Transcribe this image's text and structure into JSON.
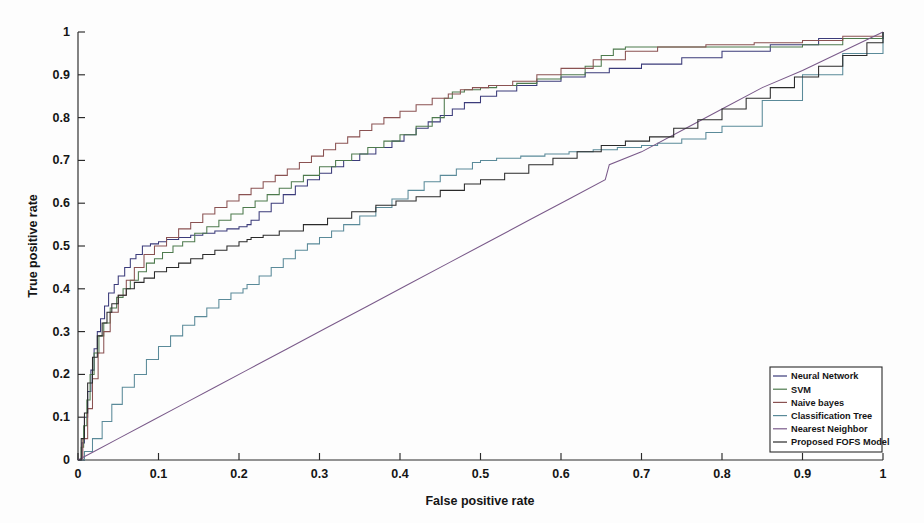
{
  "figure": {
    "background_color": "#fdfdfd",
    "type": "roc-curve-figure"
  },
  "axes": {
    "x_title": "False positive rate",
    "y_title": "True positive rate",
    "x_ticks": [
      "0",
      "0.1",
      "0.2",
      "0.3",
      "0.4",
      "0.5",
      "0.6",
      "0.7",
      "0.8",
      "0.9",
      "1"
    ],
    "y_ticks": [
      "0",
      "0.1",
      "0.2",
      "0.3",
      "0.4",
      "0.5",
      "0.6",
      "0.7",
      "0.8",
      "0.9",
      "1"
    ],
    "axis_color": "#2a2a2a"
  },
  "legend": {
    "position": "bottom-right",
    "entries": [
      {
        "label": "Neural Network",
        "color": "#3b3b7a"
      },
      {
        "label": "SVM",
        "color": "#4d7a4d"
      },
      {
        "label": "Naive bayes",
        "color": "#8a5252"
      },
      {
        "label": "Classification Tree",
        "color": "#5a8a99"
      },
      {
        "label": "Nearest Neighbor",
        "color": "#7a5a8a"
      },
      {
        "label": "Proposed FOFS Model",
        "color": "#2a2a2a"
      }
    ]
  },
  "chart_data": {
    "type": "line",
    "title": "",
    "subtitle": "",
    "xlabel": "False positive rate",
    "ylabel": "True positive rate",
    "xlim": [
      0,
      1
    ],
    "ylim": [
      0,
      1
    ],
    "grid": false,
    "legend_position": "lower right",
    "step_style": "post",
    "series": [
      {
        "name": "Neural Network",
        "color": "#3b3b7a",
        "x": [
          0,
          0.005,
          0.008,
          0.012,
          0.016,
          0.02,
          0.024,
          0.028,
          0.033,
          0.038,
          0.045,
          0.05,
          0.058,
          0.065,
          0.072,
          0.08,
          0.09,
          0.1,
          0.11,
          0.125,
          0.14,
          0.155,
          0.17,
          0.185,
          0.2,
          0.21,
          0.215,
          0.225,
          0.24,
          0.255,
          0.27,
          0.285,
          0.3,
          0.315,
          0.33,
          0.35,
          0.37,
          0.39,
          0.405,
          0.42,
          0.435,
          0.45,
          0.465,
          0.48,
          0.5,
          0.52,
          0.545,
          0.57,
          0.6,
          0.63,
          0.66,
          0.7,
          0.75,
          0.8,
          0.86,
          0.92,
          1.0
        ],
        "y": [
          0,
          0.04,
          0.1,
          0.16,
          0.21,
          0.26,
          0.3,
          0.33,
          0.36,
          0.39,
          0.41,
          0.43,
          0.45,
          0.47,
          0.48,
          0.5,
          0.505,
          0.51,
          0.515,
          0.52,
          0.525,
          0.53,
          0.535,
          0.54,
          0.545,
          0.55,
          0.56,
          0.58,
          0.6,
          0.62,
          0.64,
          0.655,
          0.67,
          0.685,
          0.7,
          0.715,
          0.73,
          0.745,
          0.76,
          0.775,
          0.79,
          0.805,
          0.82,
          0.835,
          0.85,
          0.862,
          0.875,
          0.885,
          0.895,
          0.905,
          0.915,
          0.925,
          0.94,
          0.955,
          0.97,
          0.985,
          1.0
        ]
      },
      {
        "name": "SVM",
        "color": "#4d7a4d",
        "x": [
          0,
          0.004,
          0.007,
          0.011,
          0.015,
          0.02,
          0.026,
          0.032,
          0.04,
          0.048,
          0.056,
          0.065,
          0.075,
          0.085,
          0.095,
          0.105,
          0.118,
          0.13,
          0.145,
          0.16,
          0.175,
          0.19,
          0.205,
          0.22,
          0.235,
          0.25,
          0.265,
          0.28,
          0.3,
          0.32,
          0.34,
          0.36,
          0.38,
          0.4,
          0.42,
          0.44,
          0.455,
          0.465,
          0.48,
          0.5,
          0.52,
          0.545,
          0.57,
          0.6,
          0.63,
          0.65,
          0.665,
          0.68,
          0.72,
          0.78,
          0.85,
          0.9,
          0.95,
          1.0
        ],
        "y": [
          0,
          0.03,
          0.08,
          0.14,
          0.2,
          0.25,
          0.29,
          0.32,
          0.355,
          0.38,
          0.4,
          0.42,
          0.44,
          0.46,
          0.47,
          0.485,
          0.5,
          0.51,
          0.53,
          0.545,
          0.56,
          0.575,
          0.59,
          0.605,
          0.62,
          0.635,
          0.65,
          0.665,
          0.685,
          0.7,
          0.715,
          0.73,
          0.745,
          0.76,
          0.78,
          0.8,
          0.845,
          0.86,
          0.865,
          0.87,
          0.875,
          0.88,
          0.89,
          0.9,
          0.92,
          0.945,
          0.96,
          0.965,
          0.965,
          0.965,
          0.965,
          0.97,
          0.985,
          1.0
        ]
      },
      {
        "name": "Naive bayes",
        "color": "#8a5252",
        "x": [
          0,
          0.006,
          0.012,
          0.018,
          0.025,
          0.032,
          0.04,
          0.05,
          0.06,
          0.07,
          0.082,
          0.095,
          0.11,
          0.125,
          0.14,
          0.155,
          0.17,
          0.185,
          0.2,
          0.215,
          0.23,
          0.245,
          0.26,
          0.275,
          0.29,
          0.305,
          0.32,
          0.335,
          0.35,
          0.365,
          0.38,
          0.4,
          0.42,
          0.44,
          0.46,
          0.475,
          0.49,
          0.51,
          0.54,
          0.57,
          0.6,
          0.64,
          0.68,
          0.72,
          0.78,
          0.84,
          0.9,
          0.95,
          1.0
        ],
        "y": [
          0,
          0.05,
          0.12,
          0.19,
          0.25,
          0.3,
          0.345,
          0.385,
          0.42,
          0.45,
          0.48,
          0.5,
          0.52,
          0.54,
          0.555,
          0.575,
          0.59,
          0.605,
          0.62,
          0.635,
          0.65,
          0.665,
          0.68,
          0.695,
          0.71,
          0.725,
          0.74,
          0.755,
          0.77,
          0.785,
          0.8,
          0.815,
          0.83,
          0.845,
          0.855,
          0.865,
          0.87,
          0.875,
          0.885,
          0.9,
          0.915,
          0.935,
          0.955,
          0.965,
          0.97,
          0.975,
          0.98,
          0.99,
          1.0
        ]
      },
      {
        "name": "Classification Tree",
        "color": "#5a8a99",
        "x": [
          0,
          0.008,
          0.018,
          0.03,
          0.042,
          0.055,
          0.07,
          0.085,
          0.1,
          0.115,
          0.13,
          0.145,
          0.16,
          0.175,
          0.19,
          0.205,
          0.21,
          0.225,
          0.24,
          0.255,
          0.27,
          0.285,
          0.3,
          0.315,
          0.33,
          0.35,
          0.37,
          0.39,
          0.41,
          0.43,
          0.45,
          0.47,
          0.49,
          0.5,
          0.52,
          0.55,
          0.58,
          0.61,
          0.64,
          0.67,
          0.7,
          0.72,
          0.75,
          0.78,
          0.8,
          0.85,
          0.9,
          0.95,
          1.0
        ],
        "y": [
          0,
          0.02,
          0.05,
          0.09,
          0.13,
          0.17,
          0.2,
          0.235,
          0.265,
          0.29,
          0.315,
          0.335,
          0.355,
          0.375,
          0.39,
          0.4,
          0.41,
          0.43,
          0.45,
          0.47,
          0.49,
          0.505,
          0.52,
          0.535,
          0.55,
          0.57,
          0.59,
          0.61,
          0.63,
          0.65,
          0.665,
          0.68,
          0.695,
          0.7,
          0.705,
          0.71,
          0.715,
          0.72,
          0.725,
          0.73,
          0.735,
          0.74,
          0.75,
          0.765,
          0.78,
          0.84,
          0.9,
          0.95,
          1.0
        ]
      },
      {
        "name": "Nearest Neighbor",
        "color": "#7a5a8a",
        "x": [
          0,
          0.02,
          0.05,
          0.09,
          0.13,
          0.17,
          0.21,
          0.26,
          0.31,
          0.36,
          0.41,
          0.46,
          0.51,
          0.56,
          0.61,
          0.655,
          0.66,
          0.7,
          0.75,
          0.8,
          0.85,
          0.9,
          0.95,
          1.0
        ],
        "y": [
          0,
          0.02,
          0.05,
          0.09,
          0.13,
          0.17,
          0.21,
          0.26,
          0.31,
          0.36,
          0.41,
          0.46,
          0.51,
          0.56,
          0.61,
          0.655,
          0.69,
          0.72,
          0.77,
          0.82,
          0.87,
          0.91,
          0.955,
          1.0
        ]
      },
      {
        "name": "Proposed FOFS Model",
        "color": "#2a2a2a",
        "x": [
          0,
          0.004,
          0.008,
          0.012,
          0.018,
          0.024,
          0.03,
          0.036,
          0.042,
          0.05,
          0.06,
          0.07,
          0.082,
          0.095,
          0.11,
          0.125,
          0.14,
          0.155,
          0.17,
          0.185,
          0.2,
          0.21,
          0.215,
          0.23,
          0.25,
          0.28,
          0.31,
          0.34,
          0.37,
          0.395,
          0.42,
          0.45,
          0.48,
          0.5,
          0.53,
          0.56,
          0.59,
          0.62,
          0.65,
          0.68,
          0.71,
          0.74,
          0.77,
          0.8,
          0.83,
          0.86,
          0.89,
          0.92,
          0.95,
          0.98,
          1.0
        ],
        "y": [
          0,
          0.05,
          0.11,
          0.18,
          0.24,
          0.29,
          0.32,
          0.345,
          0.365,
          0.385,
          0.4,
          0.415,
          0.425,
          0.44,
          0.45,
          0.46,
          0.47,
          0.48,
          0.49,
          0.5,
          0.51,
          0.515,
          0.52,
          0.525,
          0.535,
          0.55,
          0.565,
          0.58,
          0.595,
          0.605,
          0.615,
          0.63,
          0.645,
          0.655,
          0.67,
          0.69,
          0.705,
          0.72,
          0.735,
          0.745,
          0.755,
          0.775,
          0.795,
          0.82,
          0.845,
          0.87,
          0.895,
          0.92,
          0.945,
          0.975,
          1.0
        ]
      }
    ]
  },
  "plot_geometry": {
    "left": 78,
    "right": 883,
    "top": 32,
    "bottom": 460
  }
}
